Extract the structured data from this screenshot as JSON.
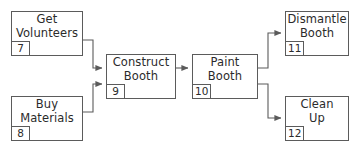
{
  "diagram": {
    "type": "flowchart",
    "stroke_color": "#5b5b5b",
    "text_color": "#2b2b2b",
    "background_color": "#ffffff",
    "nodes": [
      {
        "id": "get-volunteers",
        "label": "Get\nVolunteers",
        "tag": "7",
        "x": 11,
        "y": 11,
        "w": 72,
        "h": 45
      },
      {
        "id": "buy-materials",
        "label": "Buy\nMaterials",
        "tag": "8",
        "x": 11,
        "y": 96,
        "w": 72,
        "h": 45
      },
      {
        "id": "construct-booth",
        "label": "Construct\nBooth",
        "tag": "9",
        "x": 106,
        "y": 54,
        "w": 70,
        "h": 45
      },
      {
        "id": "paint-booth",
        "label": "Paint\nBooth",
        "tag": "10",
        "x": 192,
        "y": 54,
        "w": 66,
        "h": 45
      },
      {
        "id": "dismantle-booth",
        "label": "Dismantle\nBooth",
        "tag": "11",
        "x": 285,
        "y": 11,
        "w": 64,
        "h": 45
      },
      {
        "id": "clean-up",
        "label": "Clean\nUp",
        "tag": "12",
        "x": 285,
        "y": 96,
        "w": 64,
        "h": 45
      }
    ],
    "edges": [
      {
        "id": "get-volunteers-to-construct-booth",
        "from": "get-volunteers",
        "to": "construct-booth",
        "path": "M 83 40 L 93 40 L 93 68 L 102 68"
      },
      {
        "id": "buy-materials-to-construct-booth",
        "from": "buy-materials",
        "to": "construct-booth",
        "path": "M 83 112 L 93 112 L 93 84 L 102 84"
      },
      {
        "id": "construct-booth-to-paint-booth",
        "from": "construct-booth",
        "to": "paint-booth",
        "path": "M 176 68 L 188 68"
      },
      {
        "id": "paint-booth-to-dismantle-booth",
        "from": "paint-booth",
        "to": "dismantle-booth",
        "path": "M 258 68 L 268 68 L 268 33 L 281 33"
      },
      {
        "id": "paint-booth-to-clean-up",
        "from": "paint-booth",
        "to": "clean-up",
        "path": "M 258 84 L 268 84 L 268 118 L 281 118"
      }
    ]
  }
}
